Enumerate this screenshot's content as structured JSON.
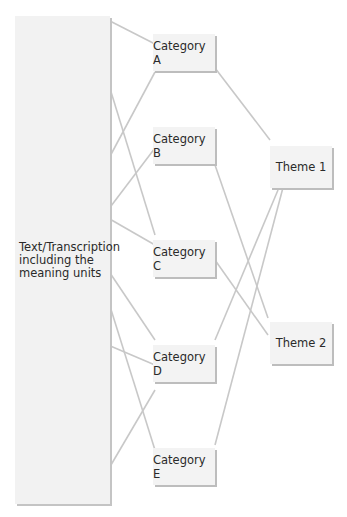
{
  "diagram": {
    "source": {
      "label": "Text/Transcription including the meaning units"
    },
    "categories": [
      {
        "id": "A",
        "label": "Category A"
      },
      {
        "id": "B",
        "label": "Category B"
      },
      {
        "id": "C",
        "label": "Category C"
      },
      {
        "id": "D",
        "label": "Category D"
      },
      {
        "id": "E",
        "label": "Category E"
      }
    ],
    "themes": [
      {
        "id": "T1",
        "label": "Theme 1"
      },
      {
        "id": "T2",
        "label": "Theme 2"
      }
    ],
    "edges": [
      [
        "source",
        "Category A"
      ],
      [
        "source",
        "Category A"
      ],
      [
        "source",
        "Category B"
      ],
      [
        "source",
        "Category C"
      ],
      [
        "source",
        "Category C"
      ],
      [
        "source",
        "Category D"
      ],
      [
        "source",
        "Category D"
      ],
      [
        "source",
        "Category E"
      ],
      [
        "source",
        "Category E"
      ],
      [
        "Category A",
        "Theme 1"
      ],
      [
        "Category B",
        "Theme 2"
      ],
      [
        "Category C",
        "Theme 2"
      ],
      [
        "Category D",
        "Theme 1"
      ],
      [
        "Category E",
        "Theme 1"
      ]
    ],
    "colors": {
      "box": "#f3f3f3",
      "shadow": "#bdbdbd",
      "line": "#c8c8c8",
      "text": "#2a2a2a"
    }
  }
}
